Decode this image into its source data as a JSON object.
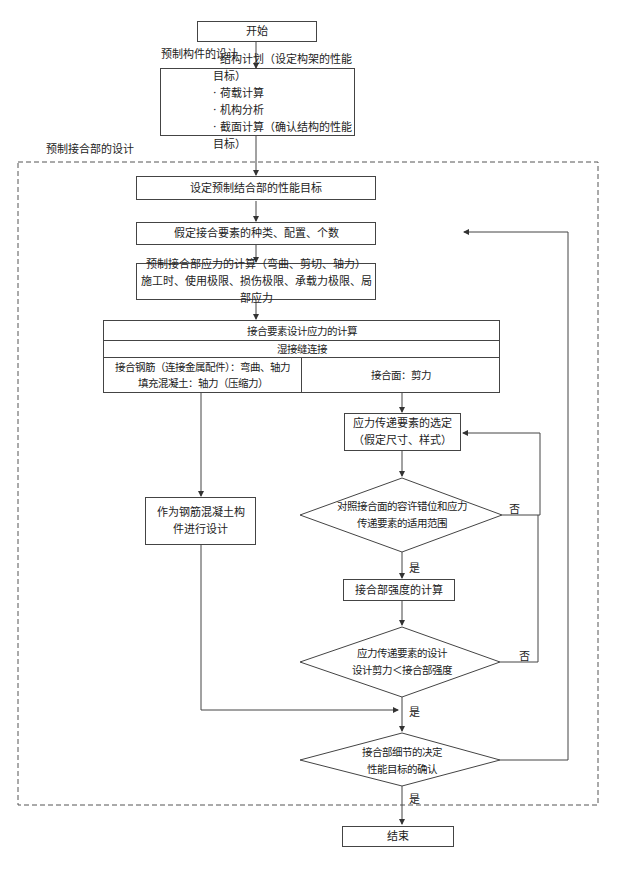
{
  "start": "开始",
  "section_precast_member": "预制构件的设计",
  "member_design_steps": [
    "· 结构计划（设定构架的性能目标）",
    "· 荷载计算",
    "· 机构分析",
    "· 截面计算（确认结构的性能目标）"
  ],
  "section_joint": "预制接合部的设计",
  "step_set_target": "设定预制结合部的性能目标",
  "step_assume_elements": "假定接合要素的种类、配置、个数",
  "step_stress_calc": {
    "line1": "预制接合部应力的计算（弯曲、剪切、轴力）",
    "line2": "施工时、使用极限、损伤极限、承载力极限、局部应力"
  },
  "design_stress_table": {
    "header": "接合要素设计应力的计算",
    "subheader": "湿接缝连接",
    "left_cell": {
      "line1": "接合钢筋（连接金属配件）：弯曲、轴力",
      "line2": "填充混凝土：轴力（压缩力）"
    },
    "right_cell": "接合面：剪力"
  },
  "step_rc_design": {
    "line1": "作为钢筋混凝土构",
    "line2": "件进行设计"
  },
  "step_select_transfer": {
    "line1": "应力传递要素的选定",
    "line2": "（假定尺寸、样式）"
  },
  "decision_check_range": {
    "line1": "对照接合面的容许错位和应力",
    "line2": "传递要素的适用范围"
  },
  "step_strength_calc": "接合部强度的计算",
  "decision_design_shear": {
    "line1": "应力传递要素的设计",
    "line2": "设计剪力＜接合部强度"
  },
  "decision_detail": {
    "line1": "接合部细节的决定",
    "line2": "性能目标的确认"
  },
  "end": "结束",
  "labels": {
    "yes": "是",
    "no": "否"
  }
}
